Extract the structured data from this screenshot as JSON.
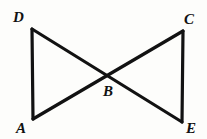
{
  "figure": {
    "kind": "geometry-diagram",
    "width": 207,
    "height": 139,
    "background_color": "#fdfdfb",
    "stroke_color": "#121212",
    "label_color": "#111111",
    "stroke_width": 3.2
  },
  "points": {
    "D": {
      "name": "D",
      "x": 32,
      "y": 29
    },
    "A": {
      "name": "A",
      "x": 33,
      "y": 119
    },
    "C": {
      "name": "C",
      "x": 183,
      "y": 31
    },
    "E": {
      "name": "E",
      "x": 182,
      "y": 122
    },
    "B": {
      "name": "B",
      "x": 107,
      "y": 74
    }
  },
  "segments": [
    {
      "id": "DA",
      "name": "segment-da",
      "from": "D",
      "to": "A"
    },
    {
      "id": "CE",
      "name": "segment-ce",
      "from": "C",
      "to": "E"
    },
    {
      "id": "DE",
      "name": "segment-de",
      "from": "D",
      "to": "E"
    },
    {
      "id": "AC",
      "name": "segment-ac",
      "from": "A",
      "to": "C"
    }
  ],
  "labels": [
    {
      "id": "D",
      "text": "D",
      "x": 13,
      "y": 10
    },
    {
      "id": "C",
      "text": "C",
      "x": 184,
      "y": 12
    },
    {
      "id": "A",
      "text": "A",
      "x": 16,
      "y": 121
    },
    {
      "id": "E",
      "text": "E",
      "x": 186,
      "y": 121
    },
    {
      "id": "B",
      "text": "B",
      "x": 103,
      "y": 84
    }
  ]
}
